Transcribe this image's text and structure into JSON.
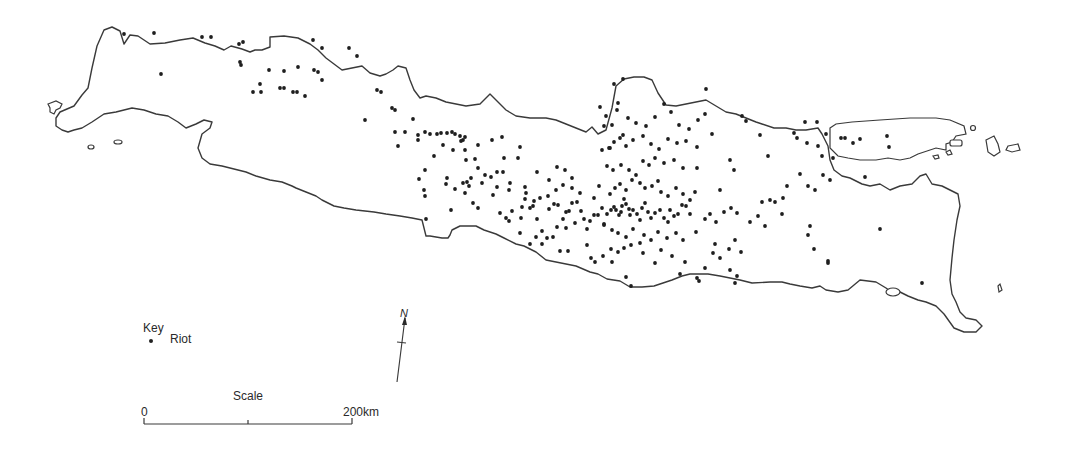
{
  "map": {
    "subject": "Java",
    "legend": {
      "title": "Key",
      "items": [
        {
          "symbol": "dot",
          "label": "Riot"
        }
      ]
    },
    "scale": {
      "title": "Scale",
      "start_label": "0",
      "end_label": "200km"
    },
    "north_arrow": {
      "label": "N"
    },
    "colors": {
      "outline": "#3a3a3a",
      "dot": "#1e1e1e",
      "background": "#ffffff"
    },
    "riots": [
      [
        124,
        34
      ],
      [
        154,
        33
      ],
      [
        161,
        74
      ],
      [
        202,
        37
      ],
      [
        211,
        37
      ],
      [
        239,
        44
      ],
      [
        243,
        42
      ],
      [
        240,
        62
      ],
      [
        241,
        65
      ],
      [
        253,
        92
      ],
      [
        260,
        84
      ],
      [
        261,
        92
      ],
      [
        269,
        70
      ],
      [
        284,
        71
      ],
      [
        280,
        88
      ],
      [
        284,
        88
      ],
      [
        298,
        67
      ],
      [
        293,
        92
      ],
      [
        297,
        92
      ],
      [
        305,
        96
      ],
      [
        313,
        40
      ],
      [
        318,
        72
      ],
      [
        322,
        80
      ],
      [
        314,
        70
      ],
      [
        322,
        48
      ],
      [
        349,
        48
      ],
      [
        357,
        56
      ],
      [
        377,
        90
      ],
      [
        381,
        92
      ],
      [
        392,
        108
      ],
      [
        395,
        110
      ],
      [
        365,
        120
      ],
      [
        395,
        132
      ],
      [
        405,
        132
      ],
      [
        398,
        146
      ],
      [
        413,
        119
      ],
      [
        418,
        135
      ],
      [
        418,
        140
      ],
      [
        425,
        132
      ],
      [
        430,
        134
      ],
      [
        437,
        134
      ],
      [
        441,
        133
      ],
      [
        447,
        133
      ],
      [
        452,
        132
      ],
      [
        455,
        134
      ],
      [
        460,
        136
      ],
      [
        465,
        137
      ],
      [
        463,
        140
      ],
      [
        478,
        145
      ],
      [
        492,
        140
      ],
      [
        502,
        137
      ],
      [
        478,
        168
      ],
      [
        504,
        158
      ],
      [
        518,
        158
      ],
      [
        520,
        147
      ],
      [
        425,
        170
      ],
      [
        443,
        145
      ],
      [
        434,
        156
      ],
      [
        453,
        150
      ],
      [
        461,
        141
      ],
      [
        465,
        150
      ],
      [
        466,
        160
      ],
      [
        475,
        159
      ],
      [
        471,
        178
      ],
      [
        469,
        186
      ],
      [
        465,
        193
      ],
      [
        473,
        203
      ],
      [
        478,
        208
      ],
      [
        500,
        213
      ],
      [
        506,
        218
      ],
      [
        512,
        211
      ],
      [
        451,
        210
      ],
      [
        426,
        219
      ],
      [
        419,
        179
      ],
      [
        424,
        190
      ],
      [
        425,
        196
      ],
      [
        447,
        178
      ],
      [
        446,
        184
      ],
      [
        455,
        189
      ],
      [
        463,
        183
      ],
      [
        467,
        182
      ],
      [
        485,
        175
      ],
      [
        491,
        177
      ],
      [
        482,
        183
      ],
      [
        497,
        172
      ],
      [
        503,
        172
      ],
      [
        497,
        187
      ],
      [
        493,
        195
      ],
      [
        510,
        183
      ],
      [
        525,
        187
      ],
      [
        526,
        193
      ],
      [
        509,
        190
      ],
      [
        525,
        199
      ],
      [
        522,
        207
      ],
      [
        530,
        208
      ],
      [
        509,
        221
      ],
      [
        521,
        218
      ],
      [
        533,
        206
      ],
      [
        537,
        219
      ],
      [
        549,
        209
      ],
      [
        554,
        204
      ],
      [
        558,
        205
      ],
      [
        563,
        219
      ],
      [
        566,
        212
      ],
      [
        569,
        211
      ],
      [
        572,
        203
      ],
      [
        577,
        202
      ],
      [
        581,
        211
      ],
      [
        584,
        219
      ],
      [
        587,
        229
      ],
      [
        590,
        221
      ],
      [
        594,
        215
      ],
      [
        598,
        215
      ],
      [
        602,
        208
      ],
      [
        604,
        224
      ],
      [
        607,
        214
      ],
      [
        611,
        210
      ],
      [
        614,
        207
      ],
      [
        616,
        210
      ],
      [
        619,
        215
      ],
      [
        621,
        212
      ],
      [
        622,
        206
      ],
      [
        624,
        199
      ],
      [
        626,
        204
      ],
      [
        629,
        209
      ],
      [
        630,
        215
      ],
      [
        633,
        210
      ],
      [
        637,
        214
      ],
      [
        640,
        220
      ],
      [
        642,
        208
      ],
      [
        645,
        203
      ],
      [
        648,
        212
      ],
      [
        651,
        218
      ],
      [
        655,
        213
      ],
      [
        660,
        210
      ],
      [
        664,
        218
      ],
      [
        668,
        222
      ],
      [
        670,
        210
      ],
      [
        674,
        216
      ],
      [
        678,
        214
      ],
      [
        682,
        205
      ],
      [
        686,
        206
      ],
      [
        690,
        214
      ],
      [
        610,
        194
      ],
      [
        615,
        188
      ],
      [
        620,
        184
      ],
      [
        626,
        190
      ],
      [
        632,
        180
      ],
      [
        640,
        183
      ],
      [
        645,
        188
      ],
      [
        652,
        186
      ],
      [
        658,
        181
      ],
      [
        661,
        192
      ],
      [
        668,
        196
      ],
      [
        676,
        188
      ],
      [
        683,
        194
      ],
      [
        690,
        200
      ],
      [
        695,
        192
      ],
      [
        607,
        166
      ],
      [
        613,
        170
      ],
      [
        621,
        165
      ],
      [
        629,
        170
      ],
      [
        636,
        175
      ],
      [
        643,
        161
      ],
      [
        649,
        165
      ],
      [
        655,
        158
      ],
      [
        664,
        163
      ],
      [
        674,
        160
      ],
      [
        683,
        168
      ],
      [
        697,
        168
      ],
      [
        602,
        150
      ],
      [
        609,
        148
      ],
      [
        614,
        142
      ],
      [
        620,
        138
      ],
      [
        626,
        146
      ],
      [
        633,
        140
      ],
      [
        643,
        136
      ],
      [
        651,
        144
      ],
      [
        659,
        149
      ],
      [
        668,
        139
      ],
      [
        677,
        143
      ],
      [
        686,
        141
      ],
      [
        697,
        147
      ],
      [
        604,
        126
      ],
      [
        612,
        125
      ],
      [
        617,
        110
      ],
      [
        623,
        135
      ],
      [
        628,
        118
      ],
      [
        636,
        123
      ],
      [
        646,
        126
      ],
      [
        655,
        117
      ],
      [
        664,
        104
      ],
      [
        671,
        112
      ],
      [
        679,
        125
      ],
      [
        689,
        129
      ],
      [
        698,
        120
      ],
      [
        705,
        114
      ],
      [
        712,
        134
      ],
      [
        706,
        89
      ],
      [
        623,
        79
      ],
      [
        614,
        84
      ],
      [
        618,
        103
      ],
      [
        600,
        107
      ],
      [
        606,
        116
      ],
      [
        610,
        148
      ],
      [
        599,
        186
      ],
      [
        594,
        198
      ],
      [
        580,
        193
      ],
      [
        572,
        188
      ],
      [
        563,
        185
      ],
      [
        556,
        190
      ],
      [
        548,
        196
      ],
      [
        540,
        198
      ],
      [
        534,
        201
      ],
      [
        572,
        178
      ],
      [
        565,
        170
      ],
      [
        557,
        167
      ],
      [
        549,
        180
      ],
      [
        537,
        172
      ],
      [
        520,
        233
      ],
      [
        542,
        231
      ],
      [
        557,
        227
      ],
      [
        566,
        228
      ],
      [
        575,
        223
      ],
      [
        604,
        225
      ],
      [
        612,
        230
      ],
      [
        618,
        233
      ],
      [
        626,
        237
      ],
      [
        633,
        229
      ],
      [
        644,
        235
      ],
      [
        651,
        240
      ],
      [
        658,
        232
      ],
      [
        667,
        238
      ],
      [
        676,
        233
      ],
      [
        683,
        240
      ],
      [
        696,
        232
      ],
      [
        705,
        219
      ],
      [
        710,
        214
      ],
      [
        716,
        222
      ],
      [
        724,
        212
      ],
      [
        731,
        208
      ],
      [
        737,
        213
      ],
      [
        715,
        244
      ],
      [
        729,
        249
      ],
      [
        735,
        240
      ],
      [
        741,
        252
      ],
      [
        720,
        258
      ],
      [
        730,
        270
      ],
      [
        750,
        222
      ],
      [
        758,
        216
      ],
      [
        765,
        226
      ],
      [
        775,
        202
      ],
      [
        783,
        198
      ],
      [
        787,
        186
      ],
      [
        800,
        174
      ],
      [
        808,
        186
      ],
      [
        815,
        190
      ],
      [
        823,
        175
      ],
      [
        830,
        180
      ],
      [
        822,
        156
      ],
      [
        833,
        158
      ],
      [
        818,
        146
      ],
      [
        807,
        143
      ],
      [
        797,
        138
      ],
      [
        794,
        133
      ],
      [
        805,
        122
      ],
      [
        817,
        122
      ],
      [
        826,
        134
      ],
      [
        841,
        138
      ],
      [
        845,
        138
      ],
      [
        853,
        143
      ],
      [
        860,
        139
      ],
      [
        887,
        136
      ],
      [
        889,
        147
      ],
      [
        865,
        177
      ],
      [
        768,
        156
      ],
      [
        762,
        202
      ],
      [
        770,
        200
      ],
      [
        782,
        214
      ],
      [
        810,
        226
      ],
      [
        808,
        235
      ],
      [
        814,
        249
      ],
      [
        828,
        263
      ],
      [
        828,
        261
      ],
      [
        880,
        229
      ],
      [
        922,
        283
      ],
      [
        742,
        116
      ],
      [
        746,
        121
      ],
      [
        760,
        135
      ],
      [
        730,
        160
      ],
      [
        734,
        170
      ],
      [
        720,
        190
      ],
      [
        685,
        262
      ],
      [
        661,
        250
      ],
      [
        631,
        286
      ],
      [
        626,
        277
      ],
      [
        612,
        262
      ],
      [
        603,
        256
      ],
      [
        591,
        258
      ],
      [
        587,
        245
      ],
      [
        568,
        251
      ],
      [
        560,
        251
      ],
      [
        553,
        237
      ],
      [
        547,
        238
      ],
      [
        542,
        244
      ],
      [
        536,
        237
      ],
      [
        530,
        244
      ],
      [
        595,
        262
      ],
      [
        680,
        274
      ],
      [
        699,
        281
      ],
      [
        737,
        276
      ],
      [
        735,
        283
      ],
      [
        697,
        278
      ],
      [
        705,
        268
      ],
      [
        713,
        253
      ],
      [
        672,
        256
      ],
      [
        655,
        263
      ],
      [
        643,
        253
      ],
      [
        640,
        243
      ],
      [
        631,
        245
      ],
      [
        624,
        248
      ],
      [
        618,
        252
      ],
      [
        611,
        249
      ]
    ]
  }
}
